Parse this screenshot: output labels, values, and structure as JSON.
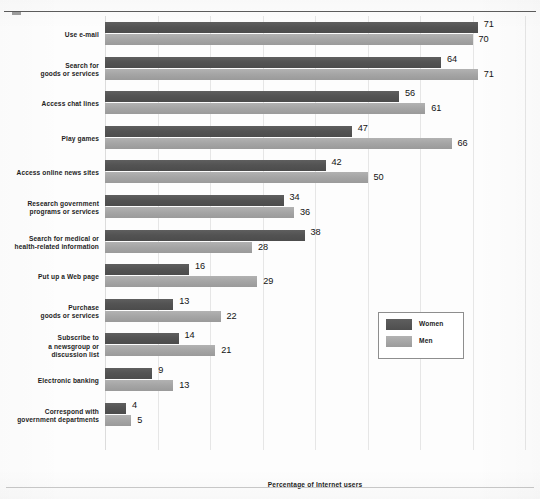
{
  "chart_data": {
    "type": "bar",
    "orientation": "horizontal",
    "title": "",
    "xlabel": "Percentage of Internet users",
    "ylabel": "",
    "xlim": [
      0,
      80
    ],
    "grid": true,
    "gridlines": [
      0,
      10,
      20,
      30,
      40,
      50,
      60,
      70,
      80
    ],
    "legend_position": "middle-right",
    "categories": [
      "Use e-mail",
      "Search for\ngoods or services",
      "Access chat lines",
      "Play games",
      "Access online news sites",
      "Research government\nprograms or services",
      "Search for medical or\nhealth-related information",
      "Put up a Web page",
      "Purchase\ngoods or services",
      "Subscribe to\na newsgroup or\ndiscussion list",
      "Electronic banking",
      "Correspond with\ngovernment departments"
    ],
    "series": [
      {
        "name": "Women",
        "color": "#535353",
        "values": [
          71,
          64,
          56,
          47,
          42,
          34,
          38,
          16,
          13,
          14,
          9,
          4
        ]
      },
      {
        "name": "Men",
        "color": "#a5a5a5",
        "values": [
          70,
          71,
          61,
          66,
          50,
          36,
          28,
          29,
          22,
          21,
          13,
          5
        ]
      }
    ]
  },
  "rows": [
    {
      "label_lines": [
        "Use e-mail"
      ],
      "women": 71,
      "men": 70
    },
    {
      "label_lines": [
        "Search for",
        "goods or services"
      ],
      "women": 64,
      "men": 71
    },
    {
      "label_lines": [
        "Access chat lines"
      ],
      "women": 56,
      "men": 61
    },
    {
      "label_lines": [
        "Play games"
      ],
      "women": 47,
      "men": 66
    },
    {
      "label_lines": [
        "Access online news sites"
      ],
      "women": 42,
      "men": 50
    },
    {
      "label_lines": [
        "Research government",
        "programs or services"
      ],
      "women": 34,
      "men": 36
    },
    {
      "label_lines": [
        "Search for medical or",
        "health-related information"
      ],
      "women": 38,
      "men": 28
    },
    {
      "label_lines": [
        "Put up a Web page"
      ],
      "women": 16,
      "men": 29
    },
    {
      "label_lines": [
        "Purchase",
        "goods or services"
      ],
      "women": 13,
      "men": 22
    },
    {
      "label_lines": [
        "Subscribe to",
        "a newsgroup or",
        "discussion list"
      ],
      "women": 14,
      "men": 21
    },
    {
      "label_lines": [
        "Electronic banking"
      ],
      "women": 9,
      "men": 13
    },
    {
      "label_lines": [
        "Correspond with",
        "government departments"
      ],
      "women": 4,
      "men": 5
    }
  ],
  "legend": {
    "items": [
      {
        "label": "Women",
        "color": "#535353"
      },
      {
        "label": "Men",
        "color": "#a5a5a5"
      }
    ]
  },
  "axis": {
    "title": "Percentage of Internet users",
    "max": 80,
    "tick_step": 10
  }
}
